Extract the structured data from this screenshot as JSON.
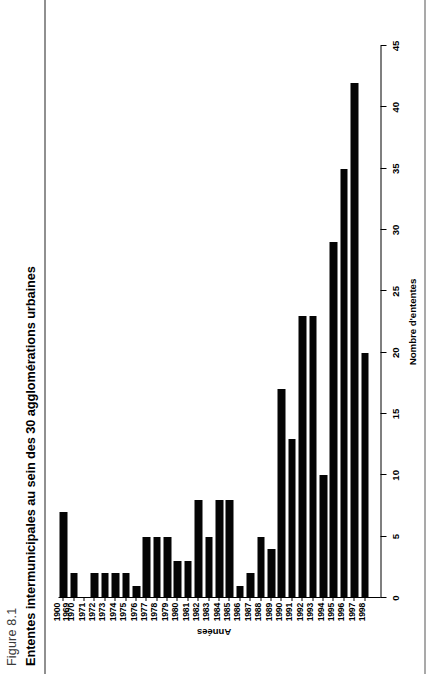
{
  "figure": {
    "label": "Figure 8.1",
    "title": "Ententes intermunicipales au sein des 30 agglomérations urbaines"
  },
  "chart_data": {
    "type": "bar",
    "orientation": "vertical",
    "title": "Ententes intermunicipales au sein des 30 agglomérations urbaines",
    "xlabel": "Années",
    "ylabel": "Nombre d'ententes",
    "ylim": [
      0,
      45
    ],
    "yticks": [
      0,
      5,
      10,
      15,
      20,
      25,
      30,
      35,
      40,
      45
    ],
    "grid": false,
    "legend": null,
    "bar_color": "#050505",
    "categories": [
      "1900\n1969",
      "1970",
      "1971",
      "1972",
      "1973",
      "1974",
      "1975",
      "1976",
      "1977",
      "1978",
      "1979",
      "1980",
      "1981",
      "1982",
      "1983",
      "1984",
      "1985",
      "1986",
      "1987",
      "1988",
      "1989",
      "1990",
      "1991",
      "1992",
      "1993",
      "1994",
      "1995",
      "1996",
      "1997",
      "1998"
    ],
    "values": [
      7,
      2,
      0,
      2,
      2,
      2,
      2,
      1,
      5,
      5,
      5,
      3,
      3,
      8,
      5,
      8,
      8,
      1,
      2,
      5,
      4,
      17,
      13,
      23,
      23,
      10,
      29,
      35,
      42,
      20
    ]
  }
}
